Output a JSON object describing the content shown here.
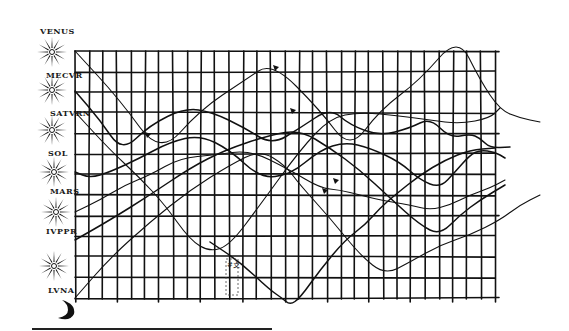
{
  "figure": {
    "grid": {
      "left": 75,
      "top": 51,
      "right": 495,
      "bottom": 298,
      "columns": 30,
      "rows": 12,
      "line_color": "#111111"
    },
    "planets": [
      {
        "label": "VENUS",
        "label_x": 40,
        "label_y": 26,
        "star_cx": 52,
        "star_cy": 52
      },
      {
        "label": "MECVR",
        "label_x": 46,
        "label_y": 70,
        "star_cx": 52,
        "star_cy": 90
      },
      {
        "label": "SATVRN",
        "label_x": 50,
        "label_y": 108,
        "star_cx": 52,
        "star_cy": 130
      },
      {
        "label": "SOL",
        "label_x": 48,
        "label_y": 148,
        "star_cx": 54,
        "star_cy": 172
      },
      {
        "label": "MARS",
        "label_x": 50,
        "label_y": 186,
        "star_cx": 56,
        "star_cy": 212
      },
      {
        "label": "IVPPR",
        "label_x": 46,
        "label_y": 226,
        "star_cx": 54,
        "star_cy": 266
      },
      {
        "label": "LVNA",
        "label_x": 48,
        "label_y": 285,
        "star_cx": 0,
        "star_cy": 0,
        "moon": true
      }
    ],
    "marginal_note": "#⽁",
    "paths": [
      {
        "name": "venus-path",
        "points": [
          [
            75,
            51
          ],
          [
            120,
            100
          ],
          [
            160,
            155
          ],
          [
            200,
            110
          ],
          [
            245,
            80
          ],
          [
            272,
            62
          ],
          [
            320,
            110
          ],
          [
            350,
            150
          ],
          [
            380,
            110
          ],
          [
            420,
            80
          ],
          [
            458,
            36
          ],
          [
            480,
            80
          ],
          [
            500,
            110
          ],
          [
            520,
            118
          ],
          [
            540,
            122
          ]
        ]
      },
      {
        "name": "mercury-path",
        "points": [
          [
            75,
            91
          ],
          [
            100,
            120
          ],
          [
            122,
            152
          ],
          [
            150,
            125
          ],
          [
            185,
            108
          ],
          [
            212,
            112
          ],
          [
            245,
            128
          ],
          [
            272,
            145
          ],
          [
            300,
            128
          ],
          [
            330,
            108
          ],
          [
            350,
            125
          ],
          [
            380,
            136
          ],
          [
            410,
            128
          ],
          [
            430,
            118
          ],
          [
            450,
            138
          ],
          [
            470,
            134
          ],
          [
            480,
            138
          ],
          [
            490,
            148
          ],
          [
            510,
            147
          ]
        ]
      },
      {
        "name": "saturn-path",
        "points": [
          [
            75,
            112
          ],
          [
            110,
            150
          ],
          [
            140,
            178
          ],
          [
            165,
            205
          ],
          [
            190,
            240
          ],
          [
            210,
            252
          ],
          [
            230,
            245
          ],
          [
            260,
            205
          ],
          [
            300,
            150
          ],
          [
            330,
            118
          ],
          [
            360,
            112
          ],
          [
            400,
            116
          ],
          [
            430,
            120
          ],
          [
            460,
            124
          ],
          [
            490,
            118
          ],
          [
            500,
            108
          ]
        ]
      },
      {
        "name": "sun-path",
        "points": [
          [
            75,
            172
          ],
          [
            90,
            178
          ],
          [
            110,
            172
          ],
          [
            140,
            158
          ],
          [
            170,
            142
          ],
          [
            200,
            135
          ],
          [
            230,
            150
          ],
          [
            260,
            178
          ],
          [
            290,
            175
          ],
          [
            320,
            150
          ],
          [
            345,
            142
          ],
          [
            370,
            148
          ],
          [
            400,
            162
          ],
          [
            420,
            180
          ],
          [
            440,
            188
          ],
          [
            455,
            172
          ],
          [
            470,
            155
          ],
          [
            480,
            150
          ],
          [
            495,
            152
          ],
          [
            505,
            158
          ]
        ]
      },
      {
        "name": "mars-path",
        "points": [
          [
            75,
            212
          ],
          [
            100,
            200
          ],
          [
            125,
            185
          ],
          [
            150,
            175
          ],
          [
            180,
            158
          ],
          [
            215,
            155
          ],
          [
            250,
            150
          ],
          [
            290,
            170
          ],
          [
            320,
            188
          ],
          [
            340,
            190
          ],
          [
            360,
            195
          ],
          [
            380,
            200
          ],
          [
            410,
            205
          ],
          [
            430,
            210
          ],
          [
            450,
            205
          ],
          [
            470,
            195
          ],
          [
            490,
            188
          ],
          [
            505,
            180
          ]
        ]
      },
      {
        "name": "jupiter-path",
        "points": [
          [
            75,
            240
          ],
          [
            110,
            220
          ],
          [
            150,
            195
          ],
          [
            190,
            168
          ],
          [
            225,
            150
          ],
          [
            270,
            135
          ],
          [
            300,
            130
          ],
          [
            330,
            148
          ],
          [
            360,
            170
          ],
          [
            390,
            198
          ],
          [
            420,
            225
          ],
          [
            440,
            235
          ],
          [
            460,
            215
          ],
          [
            480,
            200
          ],
          [
            505,
            185
          ]
        ]
      },
      {
        "name": "moon-path",
        "points": [
          [
            75,
            298
          ],
          [
            110,
            258
          ],
          [
            150,
            222
          ],
          [
            190,
            190
          ],
          [
            230,
            165
          ],
          [
            260,
            150
          ],
          [
            285,
            165
          ],
          [
            300,
            185
          ],
          [
            330,
            218
          ],
          [
            360,
            255
          ],
          [
            385,
            275
          ],
          [
            410,
            262
          ],
          [
            440,
            245
          ],
          [
            470,
            235
          ],
          [
            500,
            220
          ],
          [
            520,
            205
          ],
          [
            540,
            195
          ]
        ]
      },
      {
        "name": "descending-path",
        "points": [
          [
            210,
            242
          ],
          [
            240,
            262
          ],
          [
            270,
            290
          ],
          [
            282,
            298
          ],
          [
            290,
            305
          ],
          [
            300,
            298
          ],
          [
            320,
            270
          ],
          [
            345,
            240
          ],
          [
            365,
            225
          ],
          [
            380,
            208
          ],
          [
            395,
            195
          ],
          [
            420,
            175
          ],
          [
            445,
            160
          ],
          [
            470,
            150
          ],
          [
            495,
            148
          ]
        ]
      }
    ],
    "markers": [
      {
        "x": 148,
        "y": 134
      },
      {
        "x": 276,
        "y": 67
      },
      {
        "x": 293,
        "y": 110
      },
      {
        "x": 325,
        "y": 190
      },
      {
        "x": 336,
        "y": 180
      }
    ],
    "bottom_rule": true
  }
}
